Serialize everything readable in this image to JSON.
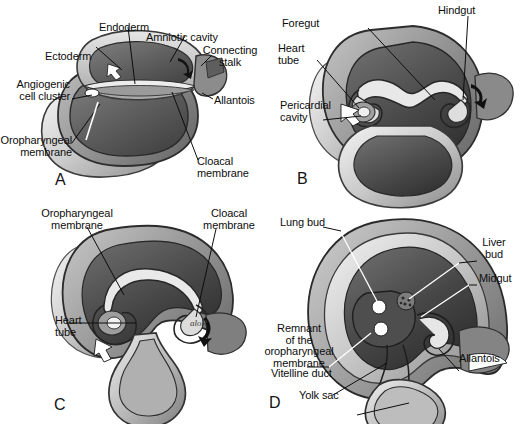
{
  "figure": {
    "background_color": "#ffffff",
    "ink_color": "#0d0d0d",
    "artist_signature": "aloR"
  },
  "panels": [
    {
      "id": "A",
      "letter": "A",
      "labels": [
        {
          "name": "ectoderm",
          "text": "Ectoderm"
        },
        {
          "name": "endoderm",
          "text": "Endoderm"
        },
        {
          "name": "amniotic-cavity",
          "text": "Amniotic cavity"
        },
        {
          "name": "connecting-stalk",
          "text": "Connecting\nstalk"
        },
        {
          "name": "allantois",
          "text": "Allantois"
        },
        {
          "name": "angiogenic-cell-cluster",
          "text": "Angiogenic\ncell cluster"
        },
        {
          "name": "oropharyngeal-membrane",
          "text": "Oropharyngeal\nmembrane"
        },
        {
          "name": "cloacal-membrane",
          "text": "Cloacal\nmembrane"
        }
      ]
    },
    {
      "id": "B",
      "letter": "B",
      "labels": [
        {
          "name": "foregut",
          "text": "Foregut"
        },
        {
          "name": "hindgut",
          "text": "Hindgut"
        },
        {
          "name": "heart-tube",
          "text": "Heart\ntube"
        },
        {
          "name": "pericardial-cavity",
          "text": "Pericardial\ncavity"
        }
      ]
    },
    {
      "id": "C",
      "letter": "C",
      "labels": [
        {
          "name": "oropharyngeal-membrane",
          "text": "Oropharyngeal\nmembrane"
        },
        {
          "name": "cloacal-membrane",
          "text": "Cloacal\nmembrane"
        },
        {
          "name": "heart-tube",
          "text": "Heart\ntube"
        }
      ]
    },
    {
      "id": "D",
      "letter": "D",
      "labels": [
        {
          "name": "lung-bud",
          "text": "Lung bud"
        },
        {
          "name": "liver-bud",
          "text": "Liver\nbud"
        },
        {
          "name": "midgut",
          "text": "Midgut"
        },
        {
          "name": "allantois",
          "text": "Allantois"
        },
        {
          "name": "remnant-oropharyngeal-membrane",
          "text": "Remnant\nof the\noropharyngeal\nmembrane"
        },
        {
          "name": "vitelline-duct",
          "text": "Vitelline duct"
        },
        {
          "name": "yolk-sac",
          "text": "Yolk sac"
        }
      ]
    }
  ]
}
